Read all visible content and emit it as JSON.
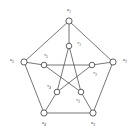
{
  "figure": {
    "name": "petersen-graph",
    "background_color": "#ffffff",
    "edge_color": "#4a4a4a",
    "vertex_fill": "#ffffff",
    "vertex_stroke": "#3a3a3a",
    "width": 136,
    "height": 131
  },
  "chart_data": {
    "type": "diagram",
    "title": "",
    "graph_name": "Petersen graph",
    "node_count": 10,
    "edge_count": 15,
    "outer_cycle": [
      "u1",
      "u2",
      "u3",
      "u4",
      "u5"
    ],
    "inner_star": [
      "v1",
      "v3",
      "v5",
      "v2",
      "v4"
    ],
    "nodes": [
      {
        "id": "u1",
        "label": "u",
        "sub": "1",
        "x": 69,
        "y": 21,
        "group": "outer",
        "label_x": 69,
        "label_y": 11,
        "r": 3.1
      },
      {
        "id": "u2",
        "label": "u",
        "sub": "2",
        "x": 113,
        "y": 62,
        "group": "outer",
        "label_x": 125,
        "label_y": 61,
        "r": 3.1
      },
      {
        "id": "u3",
        "label": "u",
        "sub": "3",
        "x": 93,
        "y": 113,
        "group": "outer",
        "label_x": 93,
        "label_y": 124,
        "r": 3.1
      },
      {
        "id": "u4",
        "label": "u",
        "sub": "4",
        "x": 44,
        "y": 113,
        "group": "outer",
        "label_x": 44,
        "label_y": 124,
        "r": 3.1
      },
      {
        "id": "u5",
        "label": "u",
        "sub": "5",
        "x": 24,
        "y": 62,
        "group": "outer",
        "label_x": 12,
        "label_y": 61,
        "r": 3.1
      },
      {
        "id": "v1",
        "label": "v",
        "sub": "1",
        "x": 69,
        "y": 46,
        "group": "inner",
        "label_x": 79,
        "label_y": 44,
        "r": 2.8
      },
      {
        "id": "v2",
        "label": "v",
        "sub": "2",
        "x": 92,
        "y": 65,
        "group": "inner",
        "label_x": 95,
        "label_y": 74,
        "r": 2.8
      },
      {
        "id": "v3",
        "label": "v",
        "sub": "3",
        "x": 81,
        "y": 92,
        "group": "inner",
        "label_x": 78,
        "label_y": 101,
        "r": 2.8
      },
      {
        "id": "v4",
        "label": "v",
        "sub": "4",
        "x": 57,
        "y": 92,
        "group": "inner",
        "label_x": 49,
        "label_y": 87,
        "r": 2.8
      },
      {
        "id": "v5",
        "label": "v",
        "sub": "5",
        "x": 44,
        "y": 65,
        "group": "inner",
        "label_x": 46,
        "label_y": 56,
        "r": 2.8
      }
    ],
    "edges": [
      {
        "from": "u1",
        "to": "u2",
        "kind": "outer"
      },
      {
        "from": "u2",
        "to": "u3",
        "kind": "outer"
      },
      {
        "from": "u3",
        "to": "u4",
        "kind": "outer"
      },
      {
        "from": "u4",
        "to": "u5",
        "kind": "outer"
      },
      {
        "from": "u5",
        "to": "u1",
        "kind": "outer"
      },
      {
        "from": "u1",
        "to": "v1",
        "kind": "spoke"
      },
      {
        "from": "u2",
        "to": "v2",
        "kind": "spoke"
      },
      {
        "from": "u3",
        "to": "v3",
        "kind": "spoke"
      },
      {
        "from": "u4",
        "to": "v4",
        "kind": "spoke"
      },
      {
        "from": "u5",
        "to": "v5",
        "kind": "spoke"
      },
      {
        "from": "v1",
        "to": "v3",
        "kind": "inner"
      },
      {
        "from": "v3",
        "to": "v5",
        "kind": "inner"
      },
      {
        "from": "v5",
        "to": "v2",
        "kind": "inner"
      },
      {
        "from": "v2",
        "to": "v4",
        "kind": "inner"
      },
      {
        "from": "v4",
        "to": "v1",
        "kind": "inner"
      }
    ]
  }
}
